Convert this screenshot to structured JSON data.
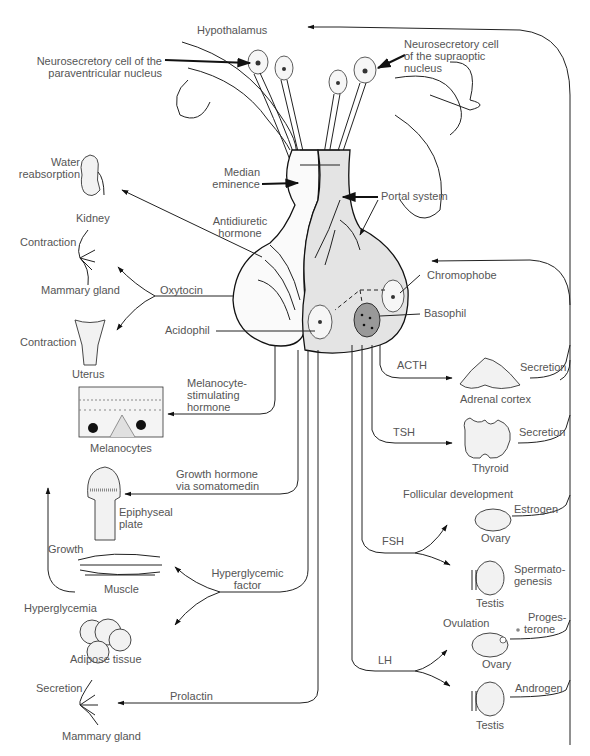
{
  "top": {
    "hypothalamus": "Hypothalamus",
    "paraventricular_label_line1": "Neurosecretory cell of the",
    "paraventricular_label_line2": "paraventricular nucleus",
    "supraoptic_label_line1": "Neurosecretory cell",
    "supraoptic_label_line2": "of the supraoptic",
    "supraoptic_label_line3": "nucleus"
  },
  "pituitary": {
    "median_eminence_line1": "Median",
    "median_eminence_line2": "eminence",
    "portal_system": "Portal system",
    "antidiuretic_line1": "Antidiuretic",
    "antidiuretic_line2": "hormone",
    "oxytocin": "Oxytocin",
    "acidophil": "Acidophil",
    "chromophobe": "Chromophobe",
    "basophil": "Basophil"
  },
  "posterior_targets": {
    "kidney": {
      "effect_line1": "Water",
      "effect_line2": "reabsorption",
      "organ": "Kidney"
    },
    "mammary_upper": {
      "effect": "Contraction",
      "organ": "Mammary gland"
    },
    "uterus": {
      "effect": "Contraction",
      "organ": "Uterus"
    }
  },
  "anterior_left": {
    "msh_line1": "Melanocyte-",
    "msh_line2": "stimulating",
    "msh_line3": "hormone",
    "melanocytes": "Melanocytes",
    "gh_line1": "Growth hormone",
    "gh_line2": "via somatomedin",
    "epiphyseal_line1": "Epiphyseal",
    "epiphyseal_line2": "plate",
    "growth": "Growth",
    "muscle": "Muscle",
    "hyperglycemic_line1": "Hyperglycemic",
    "hyperglycemic_line2": "factor",
    "hyperglycemia": "Hyperglycemia",
    "adipose": "Adipose tissue",
    "prolactin": "Prolactin",
    "secretion": "Secretion",
    "mammary_lower": "Mammary gland"
  },
  "anterior_right": {
    "acth": "ACTH",
    "adrenal": "Adrenal cortex",
    "adrenal_secretion": "Secretion",
    "tsh": "TSH",
    "thyroid": "Thyroid",
    "thyroid_secretion": "Secretion",
    "follicular": "Follicular development",
    "fsh": "FSH",
    "ovary_fsh": "Ovary",
    "estrogen": "Estrogen",
    "spermato_line1": "Spermato-",
    "spermato_line2": "genesis",
    "testis_fsh": "Testis",
    "ovulation": "Ovulation",
    "proges_line1": "Proges-",
    "proges_line2": "terone",
    "lh": "LH",
    "ovary_lh": "Ovary",
    "androgen": "Androgen",
    "testis_lh": "Testis"
  },
  "colors": {
    "line": "#222222",
    "text": "#555555",
    "gland_fill": "#e4e4e4",
    "background": "#ffffff"
  }
}
